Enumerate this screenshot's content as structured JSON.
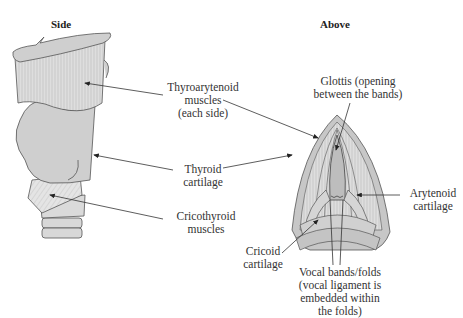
{
  "views": {
    "side": {
      "title": "Side"
    },
    "above": {
      "title": "Above"
    }
  },
  "labels": {
    "thyroarytenoid": [
      "Thyroarytenoid",
      "muscles",
      "(each side)"
    ],
    "thyroid": [
      "Thyroid",
      "cartilage"
    ],
    "cricothyroid": [
      "Cricothyroid",
      "muscles"
    ],
    "glottis": [
      "Glottis (opening",
      "between the bands)"
    ],
    "arytenoid": [
      "Arytenoid",
      "cartilage"
    ],
    "cricoid": [
      "Cricoid",
      "cartilage"
    ],
    "vocal_bands": [
      "Vocal bands/folds",
      "(vocal ligament is",
      "embedded within",
      "the folds)"
    ]
  },
  "colors": {
    "cartilage_fill": "#c9c9c9",
    "muscle_fill": "#dcdcdc",
    "outline": "#555555",
    "leader_line": "#333333"
  }
}
